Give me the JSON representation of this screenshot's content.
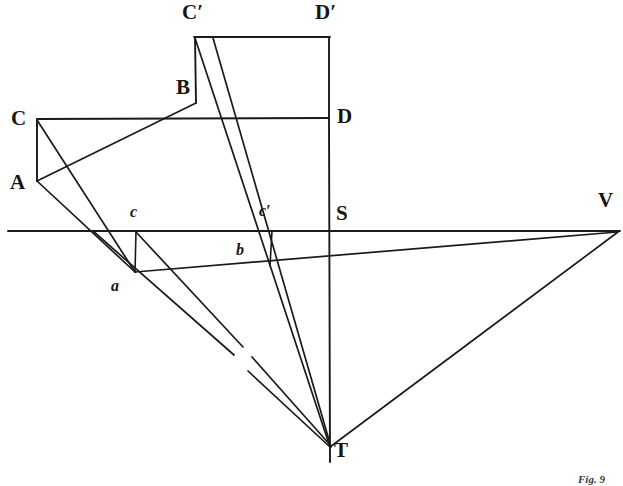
{
  "figure": {
    "caption": "Fig. 9",
    "background_color": "#ffffff",
    "ink_color": "#1a1a18",
    "width": 623,
    "height": 486
  },
  "labels": {
    "c_upper": "C",
    "a_upper": "A",
    "b_upper": "B",
    "c_prime": "C′",
    "d_prime": "D′",
    "d_upper": "D",
    "s_upper": "S",
    "v_upper": "V",
    "t_upper": "T",
    "a_lower": "a",
    "b_lower": "b",
    "c_lower": "c",
    "c_lower_prime": "c′"
  },
  "chart_data": {
    "type": "diagram",
    "title": "Fig. 9",
    "subtitle": "",
    "xlabel": "",
    "ylabel": "",
    "xlim": [
      0,
      623
    ],
    "ylim": [
      0,
      486
    ],
    "grid": false,
    "legend_position": "none",
    "points": [
      {
        "name": "C",
        "label": "C",
        "x": 37,
        "y": 120,
        "label_x": 11,
        "label_y": 108
      },
      {
        "name": "A",
        "label": "A",
        "x": 37,
        "y": 181,
        "label_x": 10,
        "label_y": 172
      },
      {
        "name": "B",
        "label": "B",
        "x": 196,
        "y": 103,
        "label_x": 176,
        "label_y": 77
      },
      {
        "name": "Cp",
        "label": "C′",
        "x": 195,
        "y": 37,
        "label_x": 182,
        "label_y": 2
      },
      {
        "name": "Dp",
        "label": "D′",
        "x": 329,
        "y": 37,
        "label_x": 315,
        "label_y": 2
      },
      {
        "name": "D",
        "label": "D",
        "x": 329,
        "y": 118,
        "label_x": 337,
        "label_y": 106
      },
      {
        "name": "S",
        "label": "S",
        "x": 329,
        "y": 231,
        "label_x": 336,
        "label_y": 203
      },
      {
        "name": "V",
        "label": "V",
        "x": 617,
        "y": 231,
        "label_x": 598,
        "label_y": 190
      },
      {
        "name": "T",
        "label": "T",
        "x": 330,
        "y": 447,
        "label_x": 334,
        "label_y": 440
      },
      {
        "name": "c",
        "label": "c",
        "x": 136,
        "y": 231,
        "label_x": 130,
        "label_y": 204
      },
      {
        "name": "a",
        "label": "a",
        "x": 135,
        "y": 272,
        "label_x": 111,
        "label_y": 278
      },
      {
        "name": "b",
        "label": "b",
        "x": 255,
        "y": 255,
        "label_x": 236,
        "label_y": 242
      },
      {
        "name": "cp",
        "label": "c′",
        "x": 272,
        "y": 231,
        "label_x": 259,
        "label_y": 203
      }
    ],
    "segments": [
      {
        "name": "horizon-line",
        "x1": 8,
        "y1": 231,
        "x2": 620,
        "y2": 231,
        "width": 1.9
      },
      {
        "name": "picture-plane-line",
        "x1": 37,
        "y1": 119,
        "x2": 329,
        "y2": 118,
        "width": 1.9
      },
      {
        "name": "rect-top-CpDp",
        "x1": 194,
        "y1": 37,
        "x2": 330,
        "y2": 37,
        "width": 1.9
      },
      {
        "name": "rect-right-DpD",
        "x1": 329,
        "y1": 37,
        "x2": 329,
        "y2": 119,
        "width": 1.9
      },
      {
        "name": "vertical-axis-S-T",
        "x1": 329,
        "y1": 119,
        "x2": 330,
        "y2": 462,
        "width": 1.9
      },
      {
        "name": "rect-left-Cp-B",
        "x1": 195,
        "y1": 37,
        "x2": 196,
        "y2": 103,
        "width": 1.9
      },
      {
        "name": "side-C-A",
        "x1": 37,
        "y1": 120,
        "x2": 37,
        "y2": 181,
        "width": 1.9
      },
      {
        "name": "diag-A-B",
        "x1": 37,
        "y1": 181,
        "x2": 196,
        "y2": 103,
        "width": 1.7
      },
      {
        "name": "diag-C-a",
        "x1": 37,
        "y1": 120,
        "x2": 135,
        "y2": 272,
        "width": 1.7
      },
      {
        "name": "edge-A-a",
        "x1": 37,
        "y1": 181,
        "x2": 135,
        "y2": 272,
        "width": 1.7
      },
      {
        "name": "base-line-a-b-V",
        "x1": 135,
        "y1": 272,
        "x2": 617,
        "y2": 232,
        "width": 1.7
      },
      {
        "name": "vert-c-a",
        "x1": 136,
        "y1": 231,
        "x2": 135,
        "y2": 272,
        "width": 1.6
      },
      {
        "name": "vert-cp-b",
        "x1": 272,
        "y1": 231,
        "x2": 270,
        "y2": 266,
        "width": 1.6
      },
      {
        "name": "ray-Cp-T",
        "x1": 195,
        "y1": 38,
        "x2": 330,
        "y2": 447,
        "width": 1.7
      },
      {
        "name": "ray-B-T",
        "x1": 213,
        "y1": 38,
        "x2": 331,
        "y2": 447,
        "width": 1.7
      },
      {
        "name": "ray-T-V",
        "x1": 330,
        "y1": 447,
        "x2": 618,
        "y2": 232,
        "width": 1.7
      },
      {
        "name": "ray-c-T-seg1",
        "x1": 136,
        "y1": 232,
        "x2": 243,
        "y2": 347,
        "width": 1.7
      },
      {
        "name": "ray-c-T-seg2",
        "x1": 252,
        "y1": 357,
        "x2": 331,
        "y2": 446,
        "width": 1.7
      },
      {
        "name": "ray-a-T-seg1",
        "x1": 93,
        "y1": 231,
        "x2": 234,
        "y2": 355,
        "width": 1.7
      },
      {
        "name": "ray-a-T-seg2",
        "x1": 248,
        "y1": 371,
        "x2": 330,
        "y2": 447,
        "width": 1.7
      }
    ]
  }
}
